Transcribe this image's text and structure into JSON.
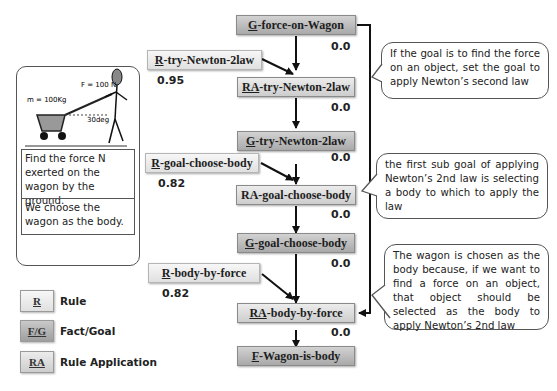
{
  "problem_panel": {
    "figure": {
      "force_label": "F = 100 N",
      "mass_label": "m = 100Kg",
      "angle_label": "30deg"
    },
    "problem_text": "Find the force N exerted on the wagon by the ground.",
    "choice_text": "We choose the wagon as the body."
  },
  "nodes": [
    {
      "id": "g1",
      "type": "goal",
      "prefix": "G",
      "rest": "-force-on-Wagon",
      "value": "0.0"
    },
    {
      "id": "r1",
      "type": "rule",
      "prefix": "R",
      "rest": "-try-Newton-2law",
      "value": "0.95"
    },
    {
      "id": "ra1",
      "type": "ra",
      "prefix": "RA",
      "rest": "-try-Newton-2law",
      "value": "0.0"
    },
    {
      "id": "g2",
      "type": "goal",
      "prefix": "G",
      "rest": "-try-Newton-2law",
      "value": "0.0"
    },
    {
      "id": "r2",
      "type": "rule",
      "prefix": "R",
      "rest": "-goal-choose-body",
      "value": "0.82"
    },
    {
      "id": "ra2",
      "type": "ra",
      "prefix": "",
      "rest": "RA-goal-choose-body",
      "value": "0.0"
    },
    {
      "id": "g3",
      "type": "goal",
      "prefix": "G",
      "rest": "-goal-choose-body",
      "value": "0.0"
    },
    {
      "id": "r3",
      "type": "rule",
      "prefix": "R",
      "rest": "-body-by-force",
      "value": "0.82"
    },
    {
      "id": "ra3",
      "type": "ra",
      "prefix": "RA",
      "rest": "-body-by-force",
      "value": "0.0"
    },
    {
      "id": "f1",
      "type": "goal",
      "prefix": "F",
      "rest": "-Wagon-is-body"
    }
  ],
  "callouts": [
    "If the goal is to find the force on an object, set the goal to apply Newton’s  second law",
    "the first sub goal of applying Newton’s 2nd law is selecting a body to which to apply the law",
    "The wagon is chosen as the body because, if we want to find a force on an object, that object should be selected as the body to apply Newton’s 2nd law"
  ],
  "legend": [
    {
      "symbol": "R",
      "label": "Rule",
      "type": "rule"
    },
    {
      "symbol": "F/G",
      "label": "Fact/Goal",
      "type": "goal"
    },
    {
      "symbol": "RA",
      "label": "Rule Application",
      "type": "ra"
    }
  ],
  "colors": {
    "goal_fill": "#b9b9b9",
    "ra_fill": "#dcdcdc",
    "rule_fill": "#ececec",
    "arrow": "#111111"
  }
}
